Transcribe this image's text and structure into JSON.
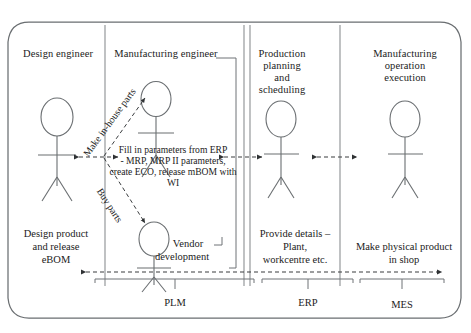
{
  "diagram": {
    "title_internal": "PLM-ERP-MES actor interaction swimlane diagram",
    "colors": {
      "line": "#55595c",
      "text": "#1b1b1b",
      "background": "#ffffff",
      "dashed": "#3a3d3f"
    },
    "lanes": [
      {
        "id": "design-engineer",
        "header": "Design engineer",
        "caption": "Design product\nand release\neBOM"
      },
      {
        "id": "manufacturing-engineer",
        "header": "Manufacturing engineer",
        "caption": ""
      },
      {
        "id": "production-planning",
        "header": "Production\nplanning\nand\nscheduling",
        "caption": "Provide details –\nPlant,\nworkcentre etc."
      },
      {
        "id": "manufacturing-operation",
        "header": "Manufacturing\noperation\nexecution",
        "caption": "Make physical product\nin shop"
      }
    ],
    "lane_headers": {
      "design_engineer": "Design engineer",
      "manufacturing_engineer": "Manufacturing engineer",
      "production_planning_l1": "Production",
      "production_planning_l2": "planning",
      "production_planning_l3": "and",
      "production_planning_l4": "scheduling",
      "manufacturing_operation_l1": "Manufacturing",
      "manufacturing_operation_l2": "operation",
      "manufacturing_operation_l3": "execution"
    },
    "lane_captions": {
      "design_product_l1": "Design product",
      "design_product_l2": "and release",
      "design_product_l3": "eBOM",
      "provide_details_l1": "Provide details –",
      "provide_details_l2": "Plant,",
      "provide_details_l3": "workcentre etc.",
      "make_physical_l1": "Make physical product",
      "make_physical_l2": "in shop"
    },
    "center_note": {
      "line1": "Fill in parameters from ERP",
      "line2": "- MRP, MRP II parameters,",
      "line3": "create ECO, release mBOM with",
      "line4": "WI"
    },
    "edge_labels": {
      "make_in_house_parts": "Make in-house parts",
      "buy_parts": "Buy parts"
    },
    "callouts": {
      "vendor_development_l1": "Vendor",
      "vendor_development_l2": "development"
    },
    "system_labels": [
      {
        "id": "plm",
        "label": "PLM"
      },
      {
        "id": "erp",
        "label": "ERP"
      },
      {
        "id": "mes",
        "label": "MES"
      }
    ],
    "system_label_map": {
      "plm": "PLM",
      "erp": "ERP",
      "mes": "MES"
    },
    "actors": [
      {
        "id": "design-engineer-actor"
      },
      {
        "id": "manufacturing-engineer-actor"
      },
      {
        "id": "vendor-actor"
      },
      {
        "id": "production-planner-actor"
      },
      {
        "id": "manufacturing-operator-actor"
      }
    ]
  }
}
